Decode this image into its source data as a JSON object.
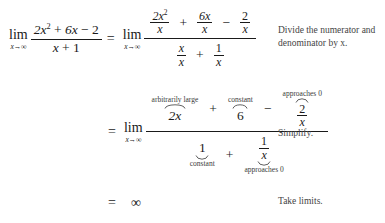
{
  "document": {
    "kind": "math-derivation",
    "background_color": "#ffffff",
    "text_color": "#1a1a1a"
  },
  "step1": {
    "lim_symbol": "lim",
    "lim_subscript": "x→∞",
    "lhs": {
      "numerator_a": "2x",
      "numerator_a_exp": "2",
      "numerator_plus": "+",
      "numerator_b": "6x",
      "numerator_minus": "−",
      "numerator_c": "2",
      "denominator_a": "x",
      "denominator_plus": "+",
      "denominator_b": "1"
    },
    "equals": "=",
    "lim2_symbol": "lim",
    "lim2_subscript": "x→∞",
    "rhs": {
      "num_t1_top": "2x",
      "num_t1_top_exp": "2",
      "num_t1_bottom": "x",
      "num_op1": "+",
      "num_t2_top": "6x",
      "num_t2_bottom": "x",
      "num_op2": "−",
      "num_t3_top": "2",
      "num_t3_bottom": "x",
      "den_t1_top": "x",
      "den_t1_bottom": "x",
      "den_op1": "+",
      "den_t2_top": "1",
      "den_t2_bottom": "x"
    },
    "note": "Divide the numerator and denominator by x."
  },
  "step2": {
    "equals": "=",
    "lim_symbol": "lim",
    "lim_subscript": "x→∞",
    "numerator": {
      "term1": "2x",
      "term1_label": "arbitrarily large",
      "op1": "+",
      "term2": "6",
      "term2_label": "constant",
      "op2": "−",
      "term3_top": "2",
      "term3_bottom": "x",
      "term3_label": "approaches 0"
    },
    "denominator": {
      "term1": "1",
      "term1_label": "constant",
      "op1": "+",
      "term2_top": "1",
      "term2_bottom": "x",
      "term2_label": "approaches 0"
    },
    "note": "Simplify."
  },
  "step3": {
    "equals": "=",
    "value": "∞",
    "note": "Take limits."
  }
}
